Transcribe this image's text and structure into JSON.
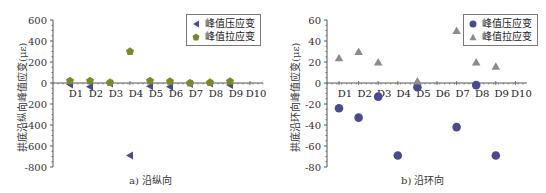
{
  "chart_data": [
    {
      "type": "scatter",
      "panel": "a",
      "title": "",
      "caption": "a) 沿纵向",
      "xlabel": "",
      "ylabel": "拱底沿纵向峰值应变(με)",
      "categories": [
        "D1",
        "D2",
        "D3",
        "D4",
        "D5",
        "D6",
        "D7",
        "D8",
        "D9",
        "D10"
      ],
      "yticks": [
        600,
        400,
        200,
        0,
        -200,
        -400,
        -600,
        -800
      ],
      "ylim": [
        -800,
        600
      ],
      "grid": false,
      "legend_position": "top-right",
      "series": [
        {
          "name": "峰值压应变",
          "marker": "triangle-left",
          "color": "#4b4a8c",
          "values": [
            -15,
            -35,
            -5,
            -690,
            -30,
            -35,
            -10,
            -5,
            -20,
            null
          ]
        },
        {
          "name": "峰值拉应变",
          "marker": "pentagon",
          "color": "#7a8a2a",
          "values": [
            20,
            20,
            5,
            300,
            20,
            15,
            0,
            5,
            15,
            null
          ]
        }
      ]
    },
    {
      "type": "scatter",
      "panel": "b",
      "title": "",
      "caption": "b) 沿环向",
      "xlabel": "",
      "ylabel": "拱底沿环向峰值应变(με)",
      "categories": [
        "D1",
        "D2",
        "D3",
        "D4",
        "D5",
        "D6",
        "D7",
        "D8",
        "D9",
        "D10"
      ],
      "yticks": [
        60,
        40,
        20,
        0,
        -20,
        -40,
        -60,
        -80
      ],
      "ylim": [
        -80,
        60
      ],
      "grid": false,
      "legend_position": "top-right",
      "series": [
        {
          "name": "峰值压应变",
          "marker": "circle",
          "color": "#4b4a8c",
          "values": [
            -24,
            -33,
            -13,
            -69,
            -4,
            null,
            -42,
            -2,
            -69,
            null
          ]
        },
        {
          "name": "峰值拉应变",
          "marker": "triangle-up",
          "color": "#8c8c8c",
          "values": [
            24,
            30,
            20,
            null,
            2,
            null,
            50,
            20,
            16,
            null
          ]
        }
      ]
    }
  ],
  "panels": {
    "a": {
      "caption": "a) 沿纵向",
      "ylabel": "拱底沿纵向峰值应变(με)",
      "legend": [
        "峰值压应变",
        "峰值拉应变"
      ]
    },
    "b": {
      "caption": "b) 沿环向",
      "ylabel": "拱底沿环向峰值应变(με)",
      "legend": [
        "峰值压应变",
        "峰值拉应变"
      ]
    }
  }
}
